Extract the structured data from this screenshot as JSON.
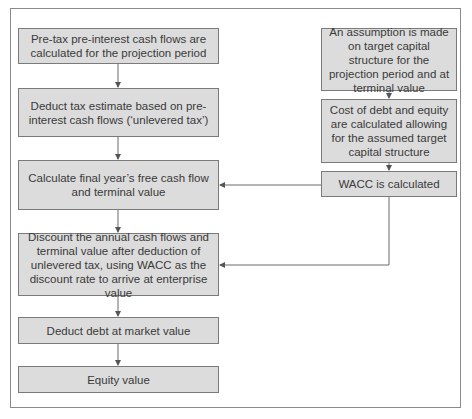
{
  "diagram": {
    "left_column": [
      {
        "id": "pretax",
        "text": "Pre-tax pre-interest cash flows are calculated for the projection period"
      },
      {
        "id": "tax",
        "text": "Deduct tax estimate based on pre-interest cash flows (‘unlevered tax’)"
      },
      {
        "id": "final",
        "text": "Calculate final year’s free cash flow and terminal value"
      },
      {
        "id": "discount",
        "text": "Discount the annual cash flows and terminal value after deduction of unlevered tax, using WACC as the discount rate to arrive at enterprise value"
      },
      {
        "id": "debt",
        "text": "Deduct debt at market value"
      },
      {
        "id": "equity",
        "text": "Equity value"
      }
    ],
    "right_column": [
      {
        "id": "assumption",
        "text": "An assumption is made on target capital structure for the projection period and at terminal value"
      },
      {
        "id": "cost",
        "text": "Cost of debt and equity are calculated allowing for the assumed target capital structure"
      },
      {
        "id": "wacc",
        "text": "WACC is calculated"
      }
    ],
    "edges": [
      [
        "pretax",
        "tax"
      ],
      [
        "tax",
        "final"
      ],
      [
        "final",
        "discount"
      ],
      [
        "discount",
        "debt"
      ],
      [
        "debt",
        "equity"
      ],
      [
        "assumption",
        "cost"
      ],
      [
        "cost",
        "wacc"
      ],
      [
        "wacc",
        "final"
      ],
      [
        "wacc",
        "discount"
      ]
    ]
  }
}
